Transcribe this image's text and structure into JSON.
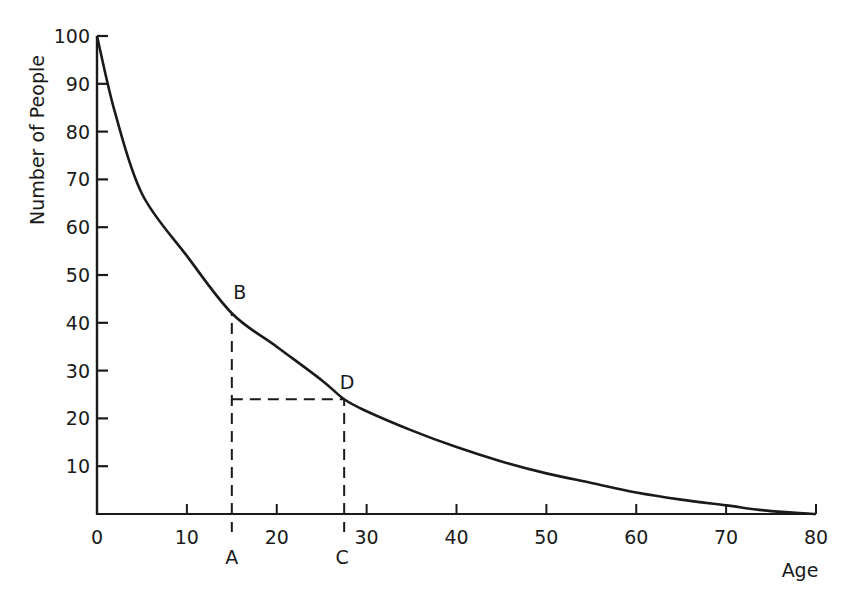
{
  "chart_data": {
    "type": "line",
    "title": "",
    "xlabel": "Age",
    "ylabel": "Number of People",
    "xlim": [
      0,
      80
    ],
    "ylim": [
      0,
      100
    ],
    "grid": false,
    "legend": null,
    "x_ticks": [
      0,
      10,
      20,
      30,
      40,
      50,
      60,
      70,
      80
    ],
    "y_ticks": [
      10,
      20,
      30,
      40,
      50,
      60,
      70,
      80,
      90,
      100
    ],
    "series": [
      {
        "name": "Survival curve",
        "x": [
          0,
          2,
          5,
          10,
          15,
          20,
          25,
          27.5,
          30,
          35,
          40,
          45,
          50,
          55,
          60,
          65,
          70,
          75,
          80
        ],
        "values": [
          100,
          84,
          67,
          54,
          42,
          35,
          28,
          24,
          21.5,
          17.5,
          14,
          11,
          8.5,
          6.5,
          4.5,
          3,
          1.8,
          0.6,
          0
        ]
      }
    ],
    "annotations": [
      {
        "label": "A",
        "x": 15,
        "y": 0,
        "position": "x-axis"
      },
      {
        "label": "B",
        "x": 15,
        "y": 42,
        "position": "on-curve"
      },
      {
        "label": "C",
        "x": 27.5,
        "y": 0,
        "position": "x-axis"
      },
      {
        "label": "D",
        "x": 27.5,
        "y": 24,
        "position": "on-curve"
      }
    ],
    "dashed_lines": [
      {
        "from": [
          15,
          0
        ],
        "to": [
          15,
          42
        ],
        "note": "A to B vertical"
      },
      {
        "from": [
          15,
          24
        ],
        "to": [
          27.5,
          24
        ],
        "note": "horizontal at D level"
      },
      {
        "from": [
          27.5,
          0
        ],
        "to": [
          27.5,
          24
        ],
        "note": "C to D vertical"
      }
    ]
  },
  "labels": {
    "xlabel": "Age",
    "ylabel": "Number of People",
    "point_a": "A",
    "point_b": "B",
    "point_c": "C",
    "point_d": "D"
  },
  "style": {
    "ink": "#1a1a1a",
    "background": "#ffffff"
  }
}
